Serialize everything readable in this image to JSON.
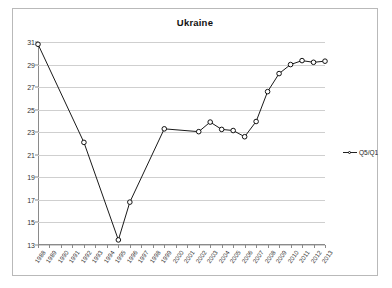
{
  "chart_data": {
    "type": "line",
    "title": "Ukraine",
    "xlabel": "",
    "ylabel": "",
    "ylim": [
      13,
      31
    ],
    "yticks": [
      13,
      15,
      17,
      19,
      21,
      23,
      25,
      27,
      29,
      31
    ],
    "grid": true,
    "legend_position": "right",
    "categories": [
      "1988",
      "1989",
      "1990",
      "1991",
      "1992",
      "1993",
      "1994",
      "1995",
      "1996",
      "1997",
      "1998",
      "1999",
      "2000",
      "2001",
      "2002",
      "2003",
      "2004",
      "2005",
      "2006",
      "2007",
      "2008",
      "2009",
      "2010",
      "2011",
      "2012",
      "2013"
    ],
    "series": [
      {
        "name": "Q5/Q1",
        "values": [
          30.8,
          null,
          null,
          null,
          22.1,
          null,
          null,
          13.45,
          16.8,
          null,
          null,
          23.3,
          null,
          null,
          23.05,
          23.9,
          23.25,
          23.15,
          22.6,
          23.95,
          26.6,
          28.2,
          29.0,
          29.35,
          29.2,
          29.3
        ]
      }
    ]
  },
  "legend": {
    "entries": [
      {
        "label": "Q5/Q1"
      }
    ]
  }
}
